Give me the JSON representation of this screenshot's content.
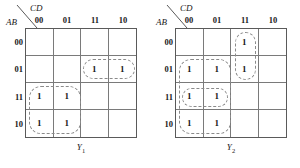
{
  "figure": {
    "type": "karnaugh-maps",
    "map_count": 2
  },
  "maps": [
    {
      "id": "Y1",
      "output_label": "Y",
      "output_subscript": "1",
      "col_var": "CD",
      "row_var": "AB",
      "col_headers": [
        "00",
        "01",
        "11",
        "10"
      ],
      "row_headers": [
        "00",
        "01",
        "11",
        "10"
      ],
      "cells": [
        [
          "",
          "",
          "",
          ""
        ],
        [
          "",
          "",
          "1",
          "1"
        ],
        [
          "1",
          "1",
          "",
          ""
        ],
        [
          "1",
          "1",
          "",
          ""
        ]
      ],
      "groups": [
        {
          "name": "group-row01-cols11-10",
          "row": 1,
          "col": 2,
          "rowspan": 1,
          "colspan": 2
        },
        {
          "name": "group-rows11-10-cols00-01",
          "row": 2,
          "col": 0,
          "rowspan": 2,
          "colspan": 2
        }
      ]
    },
    {
      "id": "Y2",
      "output_label": "Y",
      "output_subscript": "2",
      "col_var": "CD",
      "row_var": "AB",
      "col_headers": [
        "00",
        "01",
        "11",
        "10"
      ],
      "row_headers": [
        "00",
        "01",
        "11",
        "10"
      ],
      "cells": [
        [
          "",
          "",
          "1",
          ""
        ],
        [
          "1",
          "1",
          "1",
          ""
        ],
        [
          "1",
          "1",
          "",
          ""
        ],
        [
          "1",
          "1",
          "",
          ""
        ]
      ],
      "groups": [
        {
          "name": "group-rows00-01-col11",
          "row": 0,
          "col": 2,
          "rowspan": 2,
          "colspan": 1
        },
        {
          "name": "group-rows01-11-10-cols00-01",
          "row": 1,
          "col": 0,
          "rowspan": 3,
          "colspan": 2
        },
        {
          "name": "group-row11-cols00-01",
          "row": 2,
          "col": 0,
          "rowspan": 1,
          "colspan": 2
        }
      ]
    }
  ],
  "colors": {
    "grid_outer": "#5a5a5a",
    "grid_inner": "#7a7a7a",
    "loop": "#8a8a8a",
    "text": "#1a1a1a",
    "background": "#ffffff"
  }
}
